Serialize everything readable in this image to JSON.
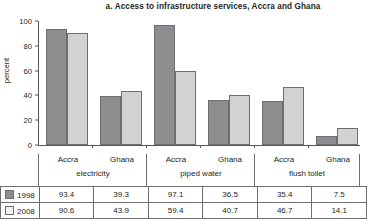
{
  "chart_data": {
    "type": "bar",
    "title": "a. Access to infrastructure services, Accra and Ghana",
    "xlabel": "",
    "ylabel": "percent",
    "ylim": [
      0,
      100
    ],
    "yticks": [
      0,
      20,
      40,
      60,
      80,
      100
    ],
    "grid": false,
    "legend_position": "table-row-labels",
    "groups": [
      {
        "service": "electricity",
        "places": [
          "Accra",
          "Ghana"
        ]
      },
      {
        "service": "piped water",
        "places": [
          "Accra",
          "Ghana"
        ]
      },
      {
        "service": "flush toilet",
        "places": [
          "Accra",
          "Ghana"
        ]
      }
    ],
    "categories": [
      "Accra electricity",
      "Ghana electricity",
      "Accra piped water",
      "Ghana piped water",
      "Accra flush toilet",
      "Ghana flush toilet"
    ],
    "series": [
      {
        "name": "1998",
        "color": "#8e8e90",
        "values": [
          93.4,
          39.3,
          97.1,
          36.5,
          35.4,
          7.5
        ]
      },
      {
        "name": "2008",
        "color": "#d2d2d2",
        "values": [
          90.6,
          43.9,
          59.4,
          40.7,
          46.7,
          14.1
        ]
      }
    ]
  },
  "table": {
    "rows": [
      {
        "label": "1998",
        "values": [
          "93.4",
          "39.3",
          "97.1",
          "36.5",
          "35.4",
          "7.5"
        ]
      },
      {
        "label": "2008",
        "values": [
          "90.6",
          "43.9",
          "59.4",
          "40.7",
          "46.7",
          "14.1"
        ]
      }
    ]
  },
  "axis": {
    "y_label": "percent",
    "y_ticks": [
      "100",
      "80",
      "60",
      "40",
      "20",
      "0"
    ]
  },
  "categories_band": {
    "places": [
      "Accra",
      "Ghana",
      "Accra",
      "Ghana",
      "Accra",
      "Ghana"
    ],
    "services": [
      "electricity",
      "piped water",
      "flush toilet"
    ]
  }
}
